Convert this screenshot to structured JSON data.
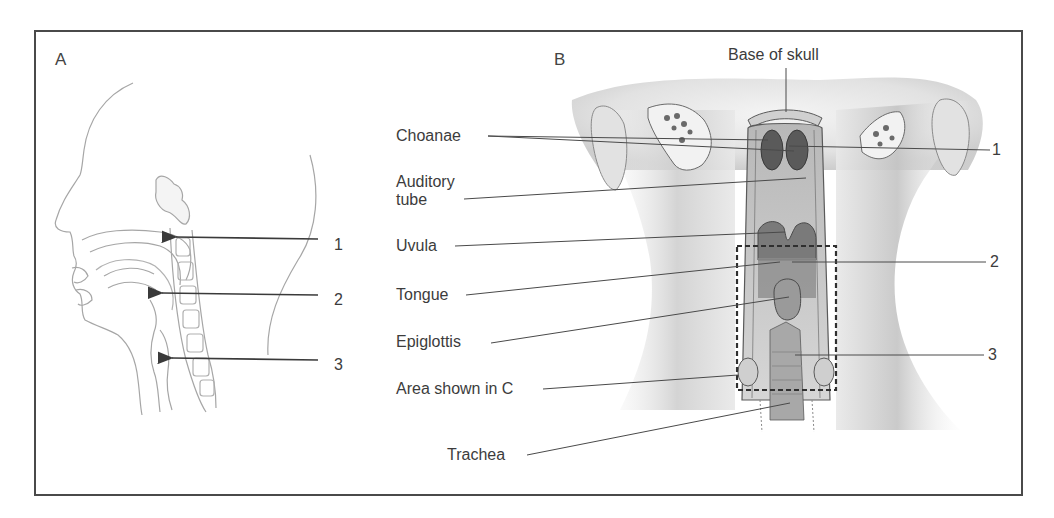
{
  "figure": {
    "panel_a": {
      "letter": "A",
      "arrows": [
        {
          "number": "1"
        },
        {
          "number": "2"
        },
        {
          "number": "3"
        }
      ]
    },
    "panel_b": {
      "letter": "B",
      "top_label": "Base of skull",
      "left_labels": [
        "Choanae",
        "Auditory",
        "tube",
        "Uvula",
        "Tongue",
        "Epiglottis",
        "Area shown in C",
        "Trachea"
      ],
      "right_numbers": [
        "1",
        "2",
        "3"
      ]
    }
  },
  "colors": {
    "frame": "#4a4a4a",
    "line_art": "#9a9a9a",
    "leader": "#4a4a4a",
    "text": "#3c3c3c"
  }
}
